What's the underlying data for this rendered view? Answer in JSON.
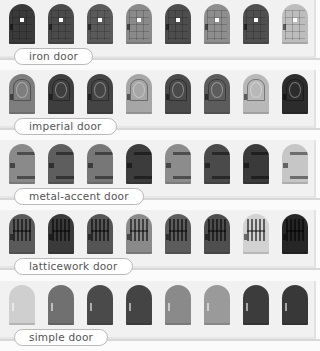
{
  "sections": [
    {
      "label": "iron door",
      "style": "iron",
      "doors": [
        "#3a3a3a",
        "#4a4a4a",
        "#5a5a5a",
        "#8a8a8a",
        "#4d4d4d",
        "#8e8e8e",
        "#4f4f4f",
        "#bdbdbd"
      ]
    },
    {
      "label": "imperial door",
      "style": "imperial",
      "doors": [
        "#7e7e7e",
        "#3e3e3e",
        "#444444",
        "#a6a6a6",
        "#4a4a4a",
        "#5c5c5c",
        "#b8b8b8",
        "#2c2c2c"
      ]
    },
    {
      "label": "metal-accent door",
      "style": "metal",
      "doors": [
        "#8a8a8a",
        "#5e5e5e",
        "#777777",
        "#3c3c3c",
        "#8c8c8c",
        "#4a4a4a",
        "#3a3a3a",
        "#c6c6c6"
      ]
    },
    {
      "label": "latticework door",
      "style": "lattice",
      "doors": [
        "#5a5a5a",
        "#3a3a3a",
        "#555555",
        "#8a8a8a",
        "#5c5c5c",
        "#4e4e4e",
        "#d2d2d2",
        "#262626"
      ]
    },
    {
      "label": "simple door",
      "style": "simple",
      "doors": [
        "#cfcfcf",
        "#707070",
        "#4a4a4a",
        "#444444",
        "#8a8a8a",
        "#9a9a9a",
        "#3c3c3c",
        "#383838"
      ]
    }
  ]
}
